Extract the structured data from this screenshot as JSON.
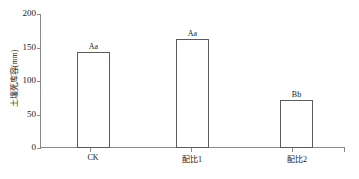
{
  "chart_data": {
    "type": "bar",
    "title": "",
    "xlabel": "",
    "ylabel": "土壤死库容(mm)",
    "categories": [
      "CK",
      "配比1",
      "配比2"
    ],
    "values": [
      143,
      163,
      72
    ],
    "annotations": [
      "Aa",
      "Aa",
      "Bb"
    ],
    "ylim": [
      0,
      200
    ],
    "yticks": [
      0,
      50,
      100,
      150,
      200
    ],
    "ytick_labels": [
      "0",
      "50",
      "100",
      "150",
      "200"
    ],
    "grid": false,
    "legend": null,
    "bar_fill_color": "#ffffff",
    "bar_edge_color": "#5b5b5b",
    "axis_color": "#8a8a8a",
    "text_color": "#202020"
  }
}
